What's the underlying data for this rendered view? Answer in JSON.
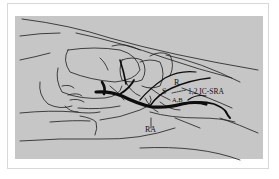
{
  "figure": {
    "type": "anatomical line drawing (wrist, dorsal view)",
    "colors": {
      "background": "#ffffff",
      "panel": "#c6c6c6",
      "ink": "#111111"
    },
    "labels": {
      "s": "S",
      "r": "R",
      "ic_sra": "1,2 IC-SRA",
      "ab": "A,B",
      "ra": "RA"
    }
  }
}
